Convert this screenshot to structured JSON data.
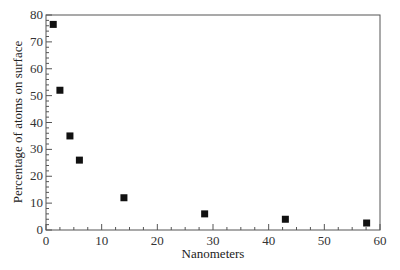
{
  "chart_data": {
    "type": "scatter",
    "title": "",
    "xlabel": "Nanometers",
    "ylabel": "Percentage of atoms on surface",
    "xlim": [
      0,
      60
    ],
    "ylim": [
      0,
      80
    ],
    "x_ticks": [
      0,
      10,
      20,
      30,
      40,
      50,
      60
    ],
    "y_ticks": [
      0,
      10,
      20,
      30,
      40,
      50,
      60,
      70,
      80
    ],
    "grid": false,
    "legend": null,
    "marker": "square",
    "series": [
      {
        "name": "surface atoms",
        "x": [
          1.3,
          2.5,
          4.3,
          6.0,
          14.0,
          28.5,
          43.0,
          57.6
        ],
        "y": [
          76.5,
          52.0,
          35.0,
          26.0,
          12.0,
          6.0,
          4.0,
          2.6
        ]
      }
    ]
  }
}
